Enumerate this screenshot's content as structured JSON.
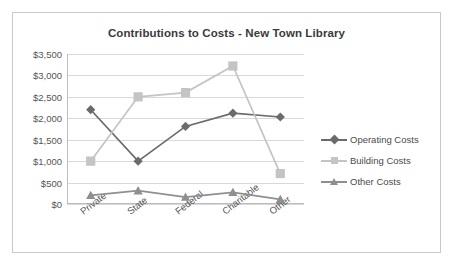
{
  "chart_data": {
    "type": "line",
    "title": "Contributions to Costs - New Town Library",
    "xlabel": "",
    "ylabel": "",
    "categories": [
      "Private",
      "State",
      "Federal",
      "Charitable",
      "Other"
    ],
    "ylim": [
      0,
      3500
    ],
    "ytick_values": [
      0,
      500,
      1000,
      1500,
      2000,
      2500,
      3000,
      3500
    ],
    "ytick_labels": [
      "$0",
      "$500",
      "$1,000",
      "$1,500",
      "$2,000",
      "$2,500",
      "$3,000",
      "$3,500"
    ],
    "grid": true,
    "legend_position": "right",
    "series": [
      {
        "name": "Operating Costs",
        "values": [
          2200,
          1000,
          1810,
          2120,
          2030
        ],
        "color": "#6b6b6b",
        "marker": "diamond"
      },
      {
        "name": "Building Costs",
        "values": [
          1000,
          2500,
          2600,
          3220,
          710
        ],
        "color": "#c4c4c4",
        "marker": "square"
      },
      {
        "name": "Other Costs",
        "values": [
          200,
          310,
          160,
          270,
          110
        ],
        "color": "#8f8f8f",
        "marker": "triangle"
      }
    ]
  },
  "frame": {
    "border_color": "#c9c9c9",
    "background": "#ffffff"
  }
}
